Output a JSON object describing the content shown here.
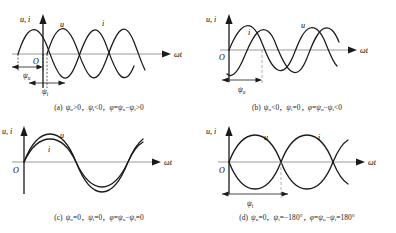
{
  "figure": {
    "axis_y_label": "u, i",
    "axis_x_label": "ωt",
    "origin_label": "O",
    "curve_u_label": "u",
    "curve_i_label": "i",
    "psi_u_label": "ψ",
    "psi_u_sub": "u",
    "psi_i_label": "ψ",
    "psi_i_sub": "i",
    "stroke_color": "#1a1a1a",
    "axis_color": "#999999"
  },
  "panels": [
    {
      "id": "a",
      "tag": "(a)",
      "caption_parts": {
        "p1_sym": "ψ",
        "p1_sub": "u",
        "p1_rel": ">0，",
        "p2_sym": "ψ",
        "p2_sub": "i",
        "p2_rel": "<0，",
        "p3_phi": "φ",
        "p3_eq": "=",
        "p3_a": "ψ",
        "p3_a_sub": "u",
        "p3_minus": "−",
        "p3_b": "ψ",
        "p3_b_sub": "i",
        "p3_rel": ">0"
      },
      "caption_text": "(a) ψu>0，ψi<0，φ=ψu−ψi>0",
      "markers": [
        "psi_u",
        "psi_i"
      ],
      "description": "u leads, i lags"
    },
    {
      "id": "b",
      "tag": "(b)",
      "caption_parts": {
        "p1_sym": "ψ",
        "p1_sub": "u",
        "p1_rel": "<0，",
        "p2_sym": "ψ",
        "p2_sub": "i",
        "p2_rel": "=0，",
        "p3_phi": "φ",
        "p3_eq": "=",
        "p3_a": "ψ",
        "p3_a_sub": "u",
        "p3_minus": "−",
        "p3_b": "ψ",
        "p3_b_sub": "i",
        "p3_rel": "<0"
      },
      "caption_text": "(b) ψu<0，ψi=0，φ=ψu−ψi<0",
      "markers": [
        "psi_u"
      ],
      "description": "i leads, u lags"
    },
    {
      "id": "c",
      "tag": "(c)",
      "caption_parts": {
        "p1_sym": "ψ",
        "p1_sub": "u",
        "p1_rel": "=0，",
        "p2_sym": "ψ",
        "p2_sub": "i",
        "p2_rel": "=0，",
        "p3_phi": "φ",
        "p3_eq": "=",
        "p3_a": "ψ",
        "p3_a_sub": "u",
        "p3_minus": "−",
        "p3_b": "ψ",
        "p3_b_sub": "i",
        "p3_rel": "=0"
      },
      "caption_text": "(c) ψu=0，ψi=0，φ=ψu−ψi=0",
      "markers": [],
      "description": "u and i in phase"
    },
    {
      "id": "d",
      "tag": "(d)",
      "caption_parts": {
        "p1_sym": "ψ",
        "p1_sub": "u",
        "p1_rel": "=0，",
        "p2_sym": "ψ",
        "p2_sub": "i",
        "p2_rel": "=−180°，",
        "p3_phi": "φ",
        "p3_eq": "=",
        "p3_a": "ψ",
        "p3_a_sub": "u",
        "p3_minus": "−",
        "p3_b": "ψ",
        "p3_b_sub": "i",
        "p3_rel": "=180°"
      },
      "caption_text": "(d) ψu=0，ψi=−180°，φ=ψu−ψi=180°",
      "markers": [
        "psi_i"
      ],
      "description": "u and i antiphase"
    }
  ]
}
